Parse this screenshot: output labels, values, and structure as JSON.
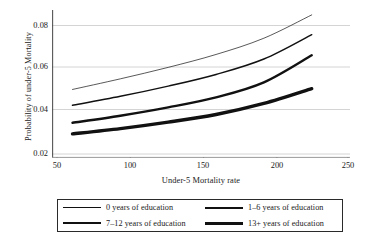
{
  "chart_data": {
    "type": "line",
    "title": "",
    "xlabel": "Under-5 Mortality rate",
    "ylabel": "Probability of under-5 Mortality",
    "xlim": [
      40,
      258
    ],
    "ylim": [
      0.0165,
      0.0885
    ],
    "xticks": [
      50,
      100,
      150,
      200,
      250
    ],
    "xticklabels": [
      "50",
      "100",
      "150",
      "200",
      "250"
    ],
    "yticks": [
      0.02,
      0.04,
      0.06,
      0.08
    ],
    "yticklabels": [
      "0.02",
      "0.04",
      "0.06",
      "0.08"
    ],
    "grid": "horizontal",
    "legend_position": "below-outside",
    "x": [
      55,
      90,
      125,
      160,
      195,
      230
    ],
    "series": [
      {
        "name": "0 years of education",
        "label": "0 years of education",
        "linewidth": 0.7,
        "color": "#111111",
        "values": [
          0.0494,
          0.0545,
          0.06,
          0.0662,
          0.074,
          0.0852
        ]
      },
      {
        "name": "1-6 years of education",
        "label": "1–6 years of education",
        "linewidth": 1.5,
        "color": "#111111",
        "values": [
          0.0418,
          0.0461,
          0.051,
          0.0566,
          0.064,
          0.0757
        ]
      },
      {
        "name": "7-12 years of education",
        "label": "7–12 years of education",
        "linewidth": 2.4,
        "color": "#111111",
        "values": [
          0.0334,
          0.0368,
          0.0408,
          0.0456,
          0.0528,
          0.0658
        ]
      },
      {
        "name": "13+ years of education",
        "label": "13+ years of education",
        "linewidth": 3.4,
        "color": "#111111",
        "values": [
          0.0281,
          0.0306,
          0.0337,
          0.0374,
          0.0427,
          0.0498
        ]
      }
    ]
  },
  "axes": {
    "ylabel": "Probability of under-5 Mortality",
    "xlabel": "Under-5 Mortality rate",
    "ytick_0": "0.08",
    "ytick_1": "0.06",
    "ytick_2": "0.04",
    "ytick_3": "0.02",
    "xtick_0": "50",
    "xtick_1": "100",
    "xtick_2": "150",
    "xtick_3": "200",
    "xtick_4": "250"
  },
  "legend": {
    "items": [
      {
        "label": "0 years of education"
      },
      {
        "label": "1–6 years of education"
      },
      {
        "label": "7–12 years of education"
      },
      {
        "label": "13+ years of education"
      }
    ]
  },
  "style": {
    "line_color": "#111111",
    "axis_color": "#555555",
    "grid_color": "#c9c9c9",
    "background": "#ffffff"
  }
}
